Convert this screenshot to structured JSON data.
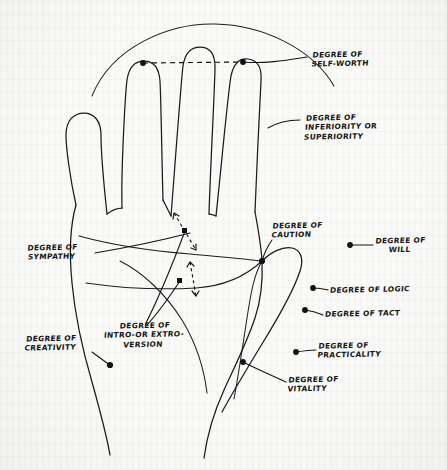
{
  "diagram": {
    "medium": "hand-drawn ink on paper",
    "ink_color": "#1b1b1b",
    "paper_color": "#fafaf8",
    "labels": [
      {
        "id": "self-worth",
        "text": "DEGREE OF\nSELF-WORTH",
        "x": 312,
        "y": 57,
        "align": "left"
      },
      {
        "id": "inferiority",
        "text": "DEGREE OF\nINFERIORITY OR\nSUPERIORITY",
        "x": 305,
        "y": 120,
        "align": "left"
      },
      {
        "id": "caution",
        "text": "DEGREE OF\nCAUTION",
        "x": 272,
        "y": 228,
        "align": "left"
      },
      {
        "id": "will",
        "text": "DEGREE OF\nWILL",
        "x": 377,
        "y": 243,
        "align": "left"
      },
      {
        "id": "logic",
        "text": "DEGREE OF LOGIC",
        "x": 330,
        "y": 290,
        "align": "left"
      },
      {
        "id": "tact",
        "text": "DEGREE OF TACT",
        "x": 325,
        "y": 314,
        "align": "left"
      },
      {
        "id": "practicality",
        "text": "DEGREE OF\nPRACTICALITY",
        "x": 318,
        "y": 347,
        "align": "left"
      },
      {
        "id": "vitality",
        "text": "DEGREE OF\nVITALITY",
        "x": 288,
        "y": 380,
        "align": "left"
      },
      {
        "id": "sympathy",
        "text": "DEGREE OF\nSYMPATHY",
        "x": 30,
        "y": 250,
        "align": "left"
      },
      {
        "id": "creativity",
        "text": "DEGREE OF\nCREATIVITY",
        "x": 28,
        "y": 340,
        "align": "left"
      },
      {
        "id": "introversion",
        "text": "DEGREE OF\nINTRO-OR EXTRO-\nVERSION",
        "x": 108,
        "y": 327,
        "align": "left"
      }
    ],
    "markers": [
      {
        "id": "fingertip-index-dot",
        "x": 143,
        "y": 63
      },
      {
        "id": "fingertip-ring-dot",
        "x": 243,
        "y": 62
      },
      {
        "id": "palm-edge-dot",
        "x": 262,
        "y": 261
      },
      {
        "id": "will-dot",
        "x": 350,
        "y": 245
      },
      {
        "id": "logic-dot",
        "x": 313,
        "y": 288
      },
      {
        "id": "tact-dot",
        "x": 305,
        "y": 310
      },
      {
        "id": "practicality-dot",
        "x": 296,
        "y": 352
      },
      {
        "id": "vitality-dot",
        "x": 243,
        "y": 362
      },
      {
        "id": "creativity-dot",
        "x": 110,
        "y": 365
      },
      {
        "id": "sympathy-square",
        "x": 185,
        "y": 231
      },
      {
        "id": "introversion-square",
        "x": 180,
        "y": 281
      }
    ],
    "measure_arrows": [
      {
        "id": "upper-span-arrow",
        "from": [
          174,
          213
        ],
        "to": [
          196,
          250
        ]
      },
      {
        "id": "lower-span-arrow",
        "from": [
          190,
          262
        ],
        "to": [
          196,
          296
        ]
      }
    ],
    "dashed_span": {
      "id": "fingertip-span",
      "from": [
        143,
        63
      ],
      "to": [
        243,
        62
      ]
    }
  }
}
